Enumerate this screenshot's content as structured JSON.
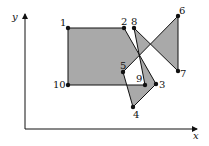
{
  "axes": {
    "x_label": "x",
    "y_label": "y"
  },
  "polygon": {
    "fill": "#a9a9a9",
    "stroke": "#111111",
    "order": [
      "1",
      "2",
      "3",
      "4",
      "5",
      "6",
      "7",
      "8",
      "9",
      "10"
    ],
    "vertices": [
      {
        "id": "1",
        "x": 68,
        "y": 28
      },
      {
        "id": "2",
        "x": 124,
        "y": 28
      },
      {
        "id": "3",
        "x": 156,
        "y": 84
      },
      {
        "id": "4",
        "x": 133,
        "y": 107
      },
      {
        "id": "5",
        "x": 123,
        "y": 72
      },
      {
        "id": "6",
        "x": 178,
        "y": 16
      },
      {
        "id": "7",
        "x": 178,
        "y": 71
      },
      {
        "id": "8",
        "x": 134,
        "y": 28
      },
      {
        "id": "9",
        "x": 145,
        "y": 85
      },
      {
        "id": "10",
        "x": 68,
        "y": 85
      }
    ]
  },
  "labels": {
    "v1": "1",
    "v2": "2",
    "v3": "3",
    "v4": "4",
    "v5": "5",
    "v6": "6",
    "v7": "7",
    "v8": "8",
    "v9": "9",
    "v10": "10"
  }
}
